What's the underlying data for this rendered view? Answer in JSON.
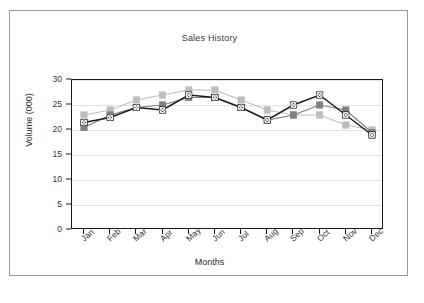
{
  "figure": {
    "frame_border_color": "#9a9a9a",
    "background_color": "#ffffff"
  },
  "chart_data": {
    "type": "line",
    "title": "Sales History",
    "xlabel": "Months",
    "ylabel": "Volume (000)",
    "categories": [
      "Jan",
      "Feb",
      "Mar",
      "Apr",
      "May",
      "Jun",
      "Jul",
      "Aug",
      "Sep",
      "Oct",
      "Nov",
      "Dec"
    ],
    "x_tick_labels": [
      "Jan",
      "Feb",
      "Mar",
      "Apr",
      "May",
      "Jun",
      "Jul",
      "Aug",
      "Sep",
      "Oct",
      "Nov",
      "Dec"
    ],
    "y_tick_labels": [
      "0",
      "5",
      "10",
      "15",
      "20",
      "25",
      "30"
    ],
    "y_ticks": [
      0,
      5,
      10,
      15,
      20,
      25,
      30
    ],
    "ylim": [
      0,
      30
    ],
    "grid": true,
    "grid_axis": "y",
    "legend": false,
    "legend_position": "none",
    "series": [
      {
        "name": "Series 1",
        "color": "#1c1c1c",
        "marker": "square-x",
        "values": [
          21.5,
          22.5,
          24.5,
          24.0,
          27.0,
          26.5,
          24.5,
          22.0,
          25.0,
          27.0,
          23.0,
          19.0
        ]
      },
      {
        "name": "Series 2",
        "color": "#808080",
        "marker": "square",
        "values": [
          20.5,
          23.0,
          24.5,
          25.0,
          26.5,
          26.5,
          24.5,
          22.0,
          23.0,
          25.0,
          24.0,
          19.5
        ]
      },
      {
        "name": "Series 3",
        "color": "#bdbdbd",
        "marker": "square",
        "values": [
          23.0,
          24.0,
          26.0,
          27.0,
          28.0,
          28.0,
          26.0,
          24.0,
          23.0,
          23.0,
          21.0,
          20.0
        ]
      }
    ]
  }
}
